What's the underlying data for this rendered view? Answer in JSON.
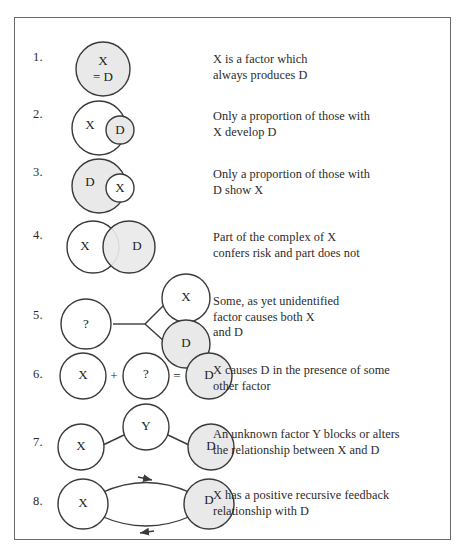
{
  "figure": {
    "rows": [
      {
        "number": "1.",
        "description": "X is a factor which\nalways produces D",
        "nodes": [
          {
            "label": "X\n= D",
            "shaded": true
          }
        ]
      },
      {
        "number": "2.",
        "description": "Only a proportion of those with\nX develop D",
        "nodes": [
          {
            "label": "X",
            "shaded": false
          },
          {
            "label": "D",
            "shaded": true
          }
        ]
      },
      {
        "number": "3.",
        "description": "Only a proportion of those with\nD show X",
        "nodes": [
          {
            "label": "D",
            "shaded": true
          },
          {
            "label": "X",
            "shaded": false
          }
        ]
      },
      {
        "number": "4.",
        "description": "Part of the complex of X\nconfers risk and part does not",
        "nodes": [
          {
            "label": "X",
            "shaded": false
          },
          {
            "label": "D",
            "shaded": true
          }
        ]
      },
      {
        "number": "5.",
        "description": "Some, as yet unidentified\nfactor causes both X\nand D",
        "nodes": [
          {
            "label": "?",
            "shaded": false
          },
          {
            "label": "X",
            "shaded": false
          },
          {
            "label": "D",
            "shaded": true
          }
        ]
      },
      {
        "number": "6.",
        "description": "X causes D in the presence of some\nother factor",
        "nodes": [
          {
            "label": "X",
            "shaded": false
          },
          {
            "label": "?",
            "shaded": false
          },
          {
            "label": "D",
            "shaded": true
          }
        ],
        "operators": [
          "+",
          "="
        ]
      },
      {
        "number": "7.",
        "description": "An unknown factor Y blocks or alters\nthe relationship between X and D",
        "nodes": [
          {
            "label": "X",
            "shaded": false
          },
          {
            "label": "Y",
            "shaded": false
          },
          {
            "label": "D",
            "shaded": true
          }
        ]
      },
      {
        "number": "8.",
        "description": "X has a positive recursive feedback\nrelationship with D",
        "nodes": [
          {
            "label": "X",
            "shaded": false
          },
          {
            "label": "D",
            "shaded": true
          }
        ]
      }
    ],
    "colors": {
      "stroke": "#3a3a3a",
      "shaded_fill": "#e9e9e9",
      "plain_fill": "#ffffff",
      "frame": "#6a6a6a",
      "text": "#2b2b2b"
    }
  }
}
